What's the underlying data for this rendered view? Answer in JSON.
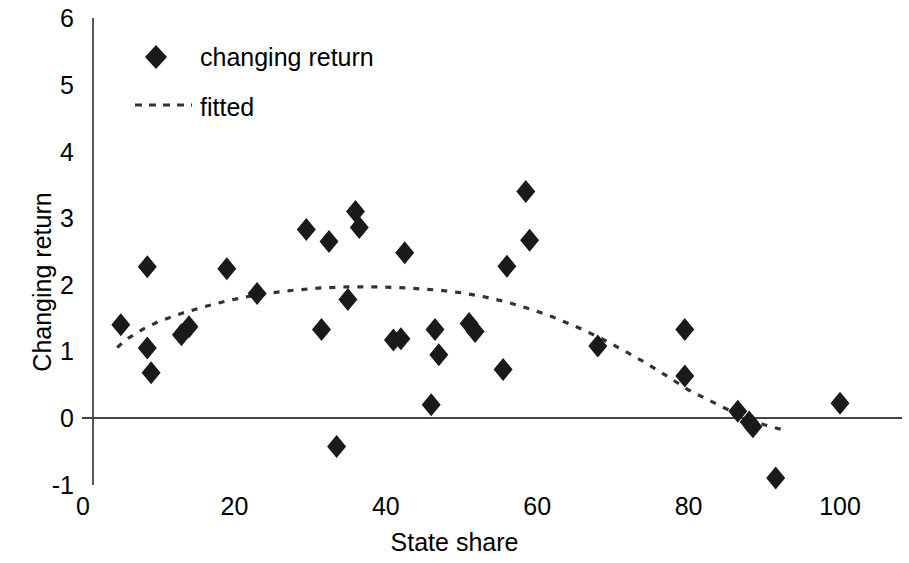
{
  "chart_data": {
    "type": "scatter",
    "title": "",
    "xlabel": "State share",
    "ylabel": "Changing return",
    "xlim": [
      0,
      107
    ],
    "ylim": [
      -1,
      6
    ],
    "xticks": [
      0,
      20,
      40,
      60,
      80,
      100
    ],
    "yticks": [
      -1,
      0,
      1,
      2,
      3,
      4,
      5,
      6
    ],
    "grid": false,
    "legend_position": "upper-left",
    "legend": [
      {
        "name": "changing return",
        "marker": "diamond",
        "color": "#1a1a1a"
      },
      {
        "name": "fitted",
        "marker": "dashed-line",
        "color": "#1a1a1a"
      }
    ],
    "series": [
      {
        "name": "changing return",
        "marker": "diamond",
        "points": [
          {
            "x": 5.0,
            "y": 1.4
          },
          {
            "x": 8.5,
            "y": 2.27
          },
          {
            "x": 8.5,
            "y": 1.05
          },
          {
            "x": 9.0,
            "y": 0.68
          },
          {
            "x": 13.0,
            "y": 1.25
          },
          {
            "x": 14.0,
            "y": 1.37
          },
          {
            "x": 19.0,
            "y": 2.24
          },
          {
            "x": 23.0,
            "y": 1.87
          },
          {
            "x": 29.5,
            "y": 2.83
          },
          {
            "x": 31.5,
            "y": 1.33
          },
          {
            "x": 32.5,
            "y": 2.65
          },
          {
            "x": 33.5,
            "y": -0.43
          },
          {
            "x": 35.0,
            "y": 1.78
          },
          {
            "x": 36.0,
            "y": 3.1
          },
          {
            "x": 36.5,
            "y": 2.86
          },
          {
            "x": 41.0,
            "y": 1.17
          },
          {
            "x": 42.0,
            "y": 1.19
          },
          {
            "x": 42.5,
            "y": 2.48
          },
          {
            "x": 46.0,
            "y": 0.2
          },
          {
            "x": 46.5,
            "y": 1.33
          },
          {
            "x": 47.0,
            "y": 0.95
          },
          {
            "x": 51.0,
            "y": 1.42
          },
          {
            "x": 51.8,
            "y": 1.3
          },
          {
            "x": 55.5,
            "y": 0.73
          },
          {
            "x": 56.0,
            "y": 2.28
          },
          {
            "x": 58.5,
            "y": 3.4
          },
          {
            "x": 59.0,
            "y": 2.67
          },
          {
            "x": 68.0,
            "y": 1.08
          },
          {
            "x": 79.5,
            "y": 1.33
          },
          {
            "x": 79.5,
            "y": 0.63
          },
          {
            "x": 86.5,
            "y": 0.1
          },
          {
            "x": 88.0,
            "y": -0.06
          },
          {
            "x": 88.5,
            "y": -0.13
          },
          {
            "x": 91.5,
            "y": -0.9
          },
          {
            "x": 100.0,
            "y": 0.22
          }
        ]
      }
    ],
    "fitted_curve": {
      "name": "fitted",
      "style": "dashed",
      "points": [
        {
          "x": 4.5,
          "y": 1.06
        },
        {
          "x": 6.0,
          "y": 1.2
        },
        {
          "x": 8.0,
          "y": 1.34
        },
        {
          "x": 10.0,
          "y": 1.45
        },
        {
          "x": 13.0,
          "y": 1.57
        },
        {
          "x": 16.0,
          "y": 1.67
        },
        {
          "x": 19.0,
          "y": 1.76
        },
        {
          "x": 23.0,
          "y": 1.85
        },
        {
          "x": 27.0,
          "y": 1.91
        },
        {
          "x": 31.0,
          "y": 1.95
        },
        {
          "x": 35.0,
          "y": 1.97
        },
        {
          "x": 39.0,
          "y": 1.97
        },
        {
          "x": 43.0,
          "y": 1.95
        },
        {
          "x": 47.0,
          "y": 1.92
        },
        {
          "x": 50.0,
          "y": 1.88
        },
        {
          "x": 53.0,
          "y": 1.82
        },
        {
          "x": 56.0,
          "y": 1.74
        },
        {
          "x": 59.0,
          "y": 1.64
        },
        {
          "x": 62.0,
          "y": 1.52
        },
        {
          "x": 65.0,
          "y": 1.38
        },
        {
          "x": 68.0,
          "y": 1.22
        },
        {
          "x": 71.0,
          "y": 1.04
        },
        {
          "x": 74.0,
          "y": 0.85
        },
        {
          "x": 77.0,
          "y": 0.64
        },
        {
          "x": 80.0,
          "y": 0.42
        },
        {
          "x": 83.0,
          "y": 0.25
        },
        {
          "x": 86.0,
          "y": 0.08
        },
        {
          "x": 88.0,
          "y": -0.03
        },
        {
          "x": 90.0,
          "y": -0.1
        },
        {
          "x": 92.5,
          "y": -0.18
        }
      ]
    }
  },
  "axes": {
    "y_title": "Changing return",
    "x_title": "State share",
    "y_tick_labels": [
      "6",
      "5",
      "4",
      "3",
      "2",
      "1",
      "0",
      "-1"
    ],
    "x_tick_labels": [
      "0",
      "20",
      "40",
      "60",
      "80",
      "100"
    ]
  },
  "legend": {
    "series_label": "changing return",
    "fitted_label": "fitted"
  },
  "colors": {
    "marker": "#1a1a1a",
    "axis": "#555555",
    "zero_line": "#444444",
    "fit_line": "#333333"
  }
}
